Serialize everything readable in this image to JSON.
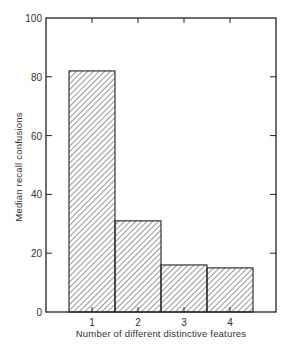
{
  "chart_data": {
    "type": "bar",
    "title": "",
    "xlabel": "Number of different distinctive features",
    "ylabel": "Median recall confusions",
    "categories": [
      "1",
      "2",
      "3",
      "4"
    ],
    "values": [
      82,
      31,
      16,
      15
    ],
    "ylim": [
      0,
      100
    ],
    "yticks": [
      0,
      20,
      40,
      60,
      80,
      100
    ],
    "ytick_labels": [
      "0",
      "20",
      "40",
      "60",
      "80",
      "100"
    ],
    "grid": false,
    "legend": null,
    "bar_fill": "diagonal hatching",
    "colors": {
      "line": "#222222",
      "hatch": "#444444",
      "background": "#ffffff"
    }
  }
}
